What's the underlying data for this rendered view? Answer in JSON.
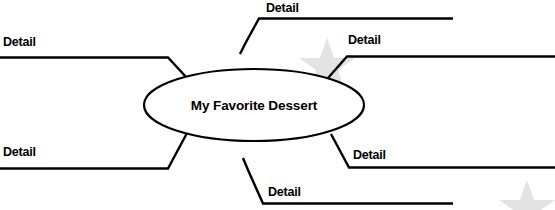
{
  "diagram": {
    "type": "web-organizer",
    "center": {
      "label": "My Favorite Dessert",
      "shape": "ellipse"
    },
    "colors": {
      "line": "#000000",
      "background": "#ffffff",
      "watermark": "#e3e3e3"
    },
    "branches": [
      {
        "id": "top-left",
        "label": "Detail",
        "position": "top-left"
      },
      {
        "id": "top-center",
        "label": "Detail",
        "position": "top-center"
      },
      {
        "id": "top-right",
        "label": "Detail",
        "position": "top-right"
      },
      {
        "id": "bottom-left",
        "label": "Detail",
        "position": "bottom-left"
      },
      {
        "id": "bottom-right",
        "label": "Detail",
        "position": "bottom-right"
      },
      {
        "id": "bottom-center",
        "label": "Detail",
        "position": "bottom-center"
      }
    ],
    "watermarks": [
      {
        "id": "star-upper",
        "shape": "star"
      },
      {
        "id": "star-lower",
        "shape": "star"
      }
    ]
  }
}
